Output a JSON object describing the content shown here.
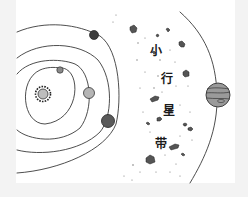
{
  "diagram": {
    "label_chars": [
      "小",
      "行",
      "星",
      "带"
    ],
    "bodies": [
      {
        "name": "sun",
        "label": "Sun"
      },
      {
        "name": "mercury",
        "label": "Mercury"
      },
      {
        "name": "venus",
        "label": "Venus"
      },
      {
        "name": "earth",
        "label": "Earth"
      },
      {
        "name": "mars",
        "label": "Mars"
      },
      {
        "name": "jupiter",
        "label": "Jupiter"
      }
    ],
    "colors": {
      "orbit_line": "#3a3a3a",
      "planet_dark": "#4a4a4a",
      "planet_gray": "#8a8a8a",
      "jupiter_fill": "#9a9a9a",
      "paper": "#ffffff",
      "background": "#f3f3f3"
    }
  }
}
